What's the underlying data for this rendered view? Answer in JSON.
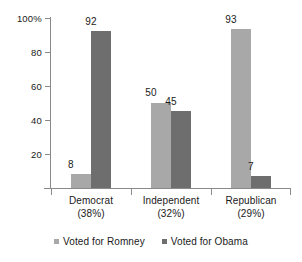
{
  "chart_data": {
    "type": "bar",
    "title": "",
    "subtitle": "",
    "xlabel": "",
    "ylabel": "",
    "ylim": [
      0,
      100
    ],
    "grid": false,
    "legend_position": "bottom",
    "categories": [
      "Democrat",
      "Independent",
      "Republican"
    ],
    "category_sublabels": [
      "(38%)",
      "(32%)",
      "(29%)"
    ],
    "category_labels_full": [
      "Democrat (38%)",
      "Independent (32%)",
      "Republican (29%)"
    ],
    "series": [
      {
        "name": "Voted for Romney",
        "color": "#a8a8a8",
        "values": [
          8,
          50,
          93
        ]
      },
      {
        "name": "Voted for Obama",
        "color": "#6e6e6e",
        "values": [
          92,
          45,
          7
        ]
      }
    ],
    "y_ticks": [
      20,
      40,
      60,
      80,
      100
    ],
    "y_tick_labels": [
      "20",
      "40",
      "60",
      "80",
      "100%"
    ],
    "data_labels": {
      "democrat": {
        "romney": "8",
        "obama": "92"
      },
      "independent": {
        "romney": "50",
        "obama": "45"
      },
      "republican": {
        "romney": "93",
        "obama": "7"
      }
    }
  },
  "axis": {
    "y": {
      "ticks": [
        {
          "label": "100%",
          "value": 100
        },
        {
          "label": "80",
          "value": 80
        },
        {
          "label": "60",
          "value": 60
        },
        {
          "label": "40",
          "value": 40
        },
        {
          "label": "20",
          "value": 20
        }
      ]
    }
  },
  "legend": {
    "items": [
      {
        "label": "Voted for Romney",
        "color": "#a8a8a8"
      },
      {
        "label": "Voted for Obama",
        "color": "#6e6e6e"
      }
    ]
  },
  "colors": {
    "romney": "#a8a8a8",
    "obama": "#6e6e6e",
    "axis": "#8a8a8a",
    "text": "#1a1a1a",
    "background": "#ffffff"
  }
}
